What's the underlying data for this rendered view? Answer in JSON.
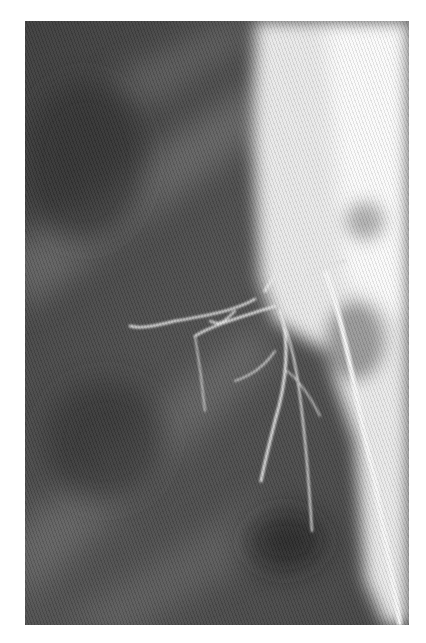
{
  "image": {
    "description": "Grayscale coronary angiography X-ray showing contrast-filled arteries branching from a bright region on the right",
    "colors": {
      "background": "#ffffff",
      "dark_tissue": "#3a3a3a",
      "mid_tissue": "#6a6a6a",
      "bright_region": "#f4f4f4"
    }
  }
}
